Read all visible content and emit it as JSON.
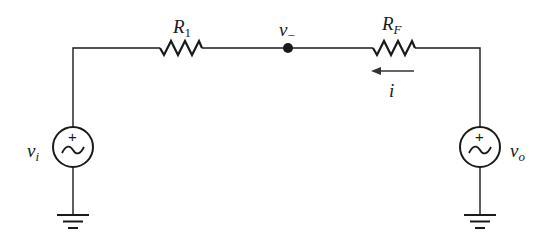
{
  "diagram": {
    "type": "circuit",
    "components": {
      "r1": {
        "label_main": "R",
        "label_sub": "1"
      },
      "rf": {
        "label_main": "R",
        "label_sub": "F"
      },
      "node": {
        "label_main": "v",
        "label_sub": "−"
      },
      "current": {
        "label": "i",
        "direction": "right-to-left"
      },
      "source_in": {
        "label_main": "v",
        "label_sub": "i",
        "polarity": "+",
        "symbol": "ac-source"
      },
      "source_out": {
        "label_main": "v",
        "label_sub": "o",
        "polarity": "+",
        "symbol": "ac-source"
      }
    },
    "colors": {
      "ink": "#1a1a1a",
      "background": "#ffffff"
    }
  }
}
